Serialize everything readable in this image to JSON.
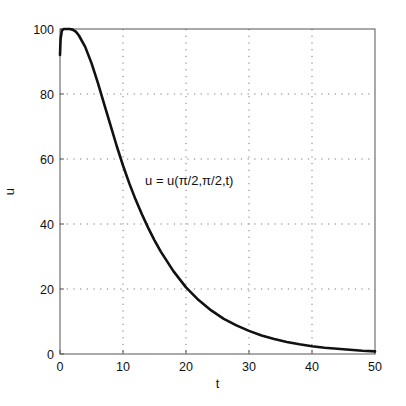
{
  "chart_data": {
    "type": "line",
    "title": "",
    "xlabel": "t",
    "ylabel": "u",
    "xlim": [
      0,
      50
    ],
    "ylim": [
      0,
      100
    ],
    "xticks": [
      0,
      10,
      20,
      30,
      40,
      50
    ],
    "yticks": [
      0,
      20,
      40,
      60,
      80,
      100
    ],
    "grid": true,
    "legend": null,
    "annotations": [
      {
        "text": "u = u(π/2,π/2,t)",
        "x": 13.5,
        "y": 52
      }
    ],
    "series": [
      {
        "name": "u(π/2,π/2,t)",
        "x": [
          0,
          0.1,
          0.3,
          0.6,
          1,
          1.5,
          2,
          2.5,
          3,
          4,
          5,
          6,
          7,
          8,
          9,
          10,
          11,
          12,
          13,
          14,
          15,
          16,
          18,
          20,
          22,
          24,
          26,
          28,
          30,
          32,
          34,
          36,
          38,
          40,
          42,
          44,
          46,
          48,
          50
        ],
        "values": [
          92,
          97,
          99.5,
          100,
          100,
          100,
          99.8,
          99.2,
          98,
          94.5,
          89.5,
          83.5,
          77,
          70.5,
          64,
          58,
          52.5,
          47.5,
          43,
          38.8,
          35,
          31.5,
          25.5,
          20.5,
          16.6,
          13.4,
          10.8,
          8.8,
          7.1,
          5.7,
          4.6,
          3.7,
          3.0,
          2.4,
          1.9,
          1.6,
          1.3,
          1.0,
          0.8
        ]
      }
    ]
  }
}
